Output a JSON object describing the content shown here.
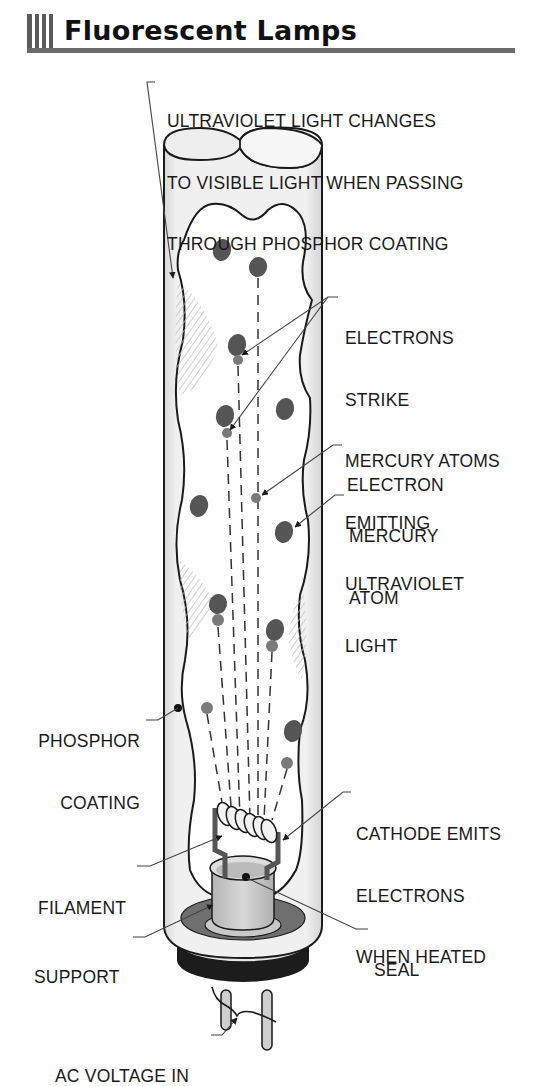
{
  "header": {
    "title": "Fluorescent Lamps",
    "bar_count": 4,
    "accent_color": "#5a5a5a"
  },
  "colors": {
    "outline": "#1a1a1a",
    "tube_glass": "#eeeeee",
    "tube_edge_shade": "#d6d6d6",
    "phosphor_inner": "#ffffff",
    "mercury_atom": "#555555",
    "electron": "#7a7a7a",
    "hatch": "#bcbcbc",
    "base_ring": "#1c1c1c",
    "seal_disc": "#6f6f6f",
    "support_cup": "#c8c8c8",
    "leader_line": "#555555"
  },
  "labels": {
    "ultraviolet": [
      "ULTRAVIOLET LIGHT CHANGES",
      "TO VISIBLE LIGHT WHEN PASSING",
      "THROUGH PHOSPHOR COATING"
    ],
    "electrons_strike": [
      "ELECTRONS",
      "STRIKE",
      "MERCURY ATOMS",
      "EMITTING",
      "ULTRAVIOLET",
      "LIGHT"
    ],
    "electron": [
      "ELECTRON"
    ],
    "mercury_atom": [
      "MERCURY",
      "ATOM"
    ],
    "phosphor_coating": [
      "PHOSPHOR",
      "COATING"
    ],
    "cathode": [
      "CATHODE EMITS",
      "ELECTRONS",
      "WHEN HEATED"
    ],
    "filament": [
      "FILAMENT"
    ],
    "seal": [
      "SEAL"
    ],
    "support": [
      "SUPPORT"
    ],
    "ac_voltage": [
      "AC VOLTAGE IN"
    ]
  },
  "diagram": {
    "mercury_atoms": [
      {
        "cx": 222,
        "cy": 250,
        "rx": 9,
        "ry": 11
      },
      {
        "cx": 258,
        "cy": 267,
        "rx": 9,
        "ry": 10
      },
      {
        "cx": 237,
        "cy": 345,
        "rx": 9,
        "ry": 11
      },
      {
        "cx": 225,
        "cy": 416,
        "rx": 9,
        "ry": 11
      },
      {
        "cx": 285,
        "cy": 409,
        "rx": 9,
        "ry": 11
      },
      {
        "cx": 199,
        "cy": 506,
        "rx": 9,
        "ry": 11
      },
      {
        "cx": 284,
        "cy": 532,
        "rx": 9,
        "ry": 11
      },
      {
        "cx": 218,
        "cy": 604,
        "rx": 9,
        "ry": 10
      },
      {
        "cx": 275,
        "cy": 630,
        "rx": 9,
        "ry": 11
      },
      {
        "cx": 293,
        "cy": 731,
        "rx": 9,
        "ry": 11
      }
    ],
    "electrons": [
      {
        "cx": 238,
        "cy": 360,
        "r": 5
      },
      {
        "cx": 227,
        "cy": 433,
        "r": 5
      },
      {
        "cx": 256,
        "cy": 498,
        "r": 5
      },
      {
        "cx": 218,
        "cy": 620,
        "r": 6
      },
      {
        "cx": 272,
        "cy": 646,
        "r": 6
      },
      {
        "cx": 207,
        "cy": 708,
        "r": 6
      },
      {
        "cx": 287,
        "cy": 763,
        "r": 6
      }
    ],
    "electron_paths": [
      {
        "x1": 258,
        "y1": 278,
        "x2": 258,
        "y2": 820
      },
      {
        "x1": 238,
        "y1": 366,
        "x2": 250,
        "y2": 820
      },
      {
        "x1": 227,
        "y1": 440,
        "x2": 240,
        "y2": 820
      },
      {
        "x1": 218,
        "y1": 627,
        "x2": 232,
        "y2": 820
      },
      {
        "x1": 272,
        "y1": 652,
        "x2": 264,
        "y2": 820
      },
      {
        "x1": 207,
        "y1": 714,
        "x2": 225,
        "y2": 820
      },
      {
        "x1": 287,
        "y1": 769,
        "x2": 272,
        "y2": 820
      }
    ]
  }
}
